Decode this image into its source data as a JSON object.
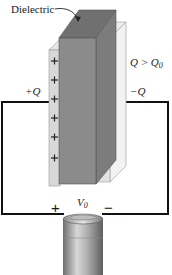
{
  "figure": {
    "dielectric_label": "Dielectric",
    "condition_label_main": "Q > Q",
    "condition_label_sub": "0",
    "left_plate_charge": "+Q",
    "right_plate_charge": "−Q",
    "battery": {
      "voltage_main": "V",
      "voltage_sub": "0",
      "positive_terminal": "+",
      "negative_terminal": "−"
    },
    "left_plate_signs": [
      "+",
      "+",
      "+",
      "+",
      "+",
      "+"
    ],
    "right_plate_signs": [
      "−",
      "−",
      "−",
      "−",
      "−",
      "−"
    ]
  },
  "colors": {
    "dielectric_front": "#8a8a8a",
    "dielectric_top": "#6f6f6f",
    "dielectric_side": "#7a7a7a",
    "plate_left": "#d9d9d9",
    "plate_right_front": "#e4e4e4",
    "plate_right_side": "#f0f0f0",
    "wire": "#111111",
    "battery_body": "#9a9a9a"
  }
}
